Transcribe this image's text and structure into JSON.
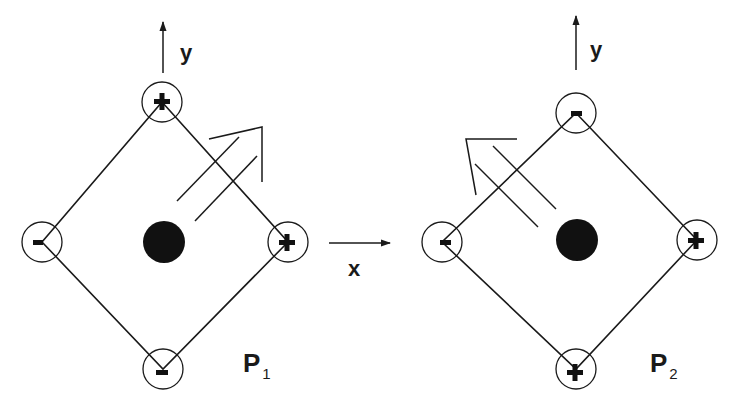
{
  "figure": {
    "type": "diagram",
    "colors": {
      "line": "#1a1a1a",
      "dot": "#111111",
      "background": "#ffffff"
    }
  },
  "x_axis": {
    "label": "x",
    "arrow_direction": "right"
  },
  "panels": [
    {
      "id": "P1",
      "label_main": "P",
      "label_sub": "1",
      "y_axis_label": "y",
      "corners": {
        "top": "+",
        "right": "+",
        "bottom": "-",
        "left": "-"
      },
      "diagonal_arrow_direction": "upper-right"
    },
    {
      "id": "P2",
      "label_main": "P",
      "label_sub": "2",
      "y_axis_label": "y",
      "corners": {
        "top": "-",
        "right": "+",
        "bottom": "+",
        "left": "-"
      },
      "diagonal_arrow_direction": "upper-left"
    }
  ]
}
